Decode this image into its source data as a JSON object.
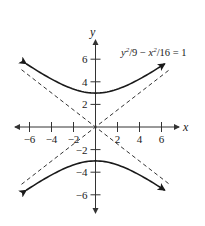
{
  "chart_data": {
    "type": "line",
    "title": "",
    "equation": "y²/9 − x²/16 = 1",
    "xlabel": "x",
    "ylabel": "y",
    "xlim": [
      -7,
      7
    ],
    "ylim": [
      -7,
      7
    ],
    "grid": false,
    "x_ticks": [
      -6,
      -4,
      -2,
      2,
      4,
      6
    ],
    "y_ticks": [
      -6,
      -4,
      -2,
      2,
      4,
      6
    ],
    "x_tick_labels": [
      "-6",
      "-4",
      "-2",
      "2",
      "4",
      "6"
    ],
    "y_tick_labels": [
      "-6",
      "-4",
      "-2",
      "2",
      "4",
      "6"
    ],
    "series": [
      {
        "name": "upper branch",
        "style": "solid",
        "function": "y = 3*sqrt(1 + x^2/16)",
        "x": [
          -6.3,
          -6,
          -4,
          -2,
          0,
          2,
          4,
          6,
          6.3
        ],
        "y": [
          5.59,
          5.41,
          4.24,
          3.35,
          3.0,
          3.35,
          4.24,
          5.41,
          5.59
        ]
      },
      {
        "name": "lower branch",
        "style": "solid",
        "function": "y = -3*sqrt(1 + x^2/16)",
        "x": [
          -6.3,
          -6,
          -4,
          -2,
          0,
          2,
          4,
          6,
          6.3
        ],
        "y": [
          -5.59,
          -5.41,
          -4.24,
          -3.35,
          -3.0,
          -3.35,
          -4.24,
          -5.41,
          -5.59
        ]
      },
      {
        "name": "asymptote y = 3x/4",
        "style": "dashed",
        "x": [
          -7,
          7
        ],
        "y": [
          -5.25,
          5.25
        ]
      },
      {
        "name": "asymptote y = -3x/4",
        "style": "dashed",
        "x": [
          -7,
          7
        ],
        "y": [
          5.25,
          -5.25
        ]
      }
    ],
    "annotations": [
      {
        "text": "y²/9 − x²/16 = 1",
        "x": 4.3,
        "y": 6.3
      }
    ]
  },
  "labels": {
    "x_axis": "x",
    "y_axis": "y",
    "equation_y": "y",
    "equation_y_exp": "2",
    "equation_mid": "/9 − ",
    "equation_x": "x",
    "equation_x_exp": "2",
    "equation_end": "/16 = 1"
  },
  "colors": {
    "curve": "#1a1a1a",
    "asymptote": "#333333",
    "axis": "#333333",
    "background": "#ffffff"
  }
}
